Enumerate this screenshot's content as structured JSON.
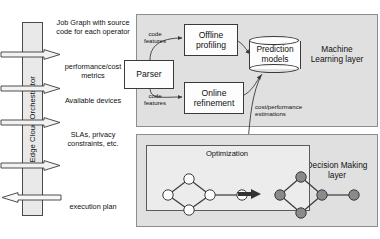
{
  "orchestrator": {
    "label": "Edge Cloud Orchestrator"
  },
  "flows": [
    {
      "name": "job-graph",
      "label": "Job Graph with source code for each operator",
      "direction": "right"
    },
    {
      "name": "perf-metrics",
      "label": "performance/cost metrics",
      "direction": "right"
    },
    {
      "name": "devices",
      "label": "Available devices",
      "direction": "right"
    },
    {
      "name": "slas",
      "label": "SLAs, privacy constraints, etc.",
      "direction": "right"
    },
    {
      "name": "exec-plan",
      "label": "execution plan",
      "direction": "left"
    }
  ],
  "ml_layer": {
    "label": "Machine Learning layer",
    "nodes": {
      "parser": "Parser",
      "offline": "Offline profiling",
      "online": "Online refinement",
      "prediction": "Prediction models"
    },
    "edge_labels": {
      "code_features_top": "code features",
      "code_features_bottom": "code features",
      "cost_performance": "cost/performance estimations"
    }
  },
  "dm_layer": {
    "label": "Decision Making layer",
    "optimization_title": "Optimization",
    "graph_before": {
      "nodes": [
        {
          "id": "a",
          "cx": 12,
          "cy": 32,
          "filled": false
        },
        {
          "id": "b",
          "cx": 33,
          "cy": 16,
          "filled": false
        },
        {
          "id": "c",
          "cx": 33,
          "cy": 47,
          "filled": false
        },
        {
          "id": "d",
          "cx": 54,
          "cy": 32,
          "filled": false
        },
        {
          "id": "e",
          "cx": 86,
          "cy": 32,
          "filled": false
        }
      ],
      "edges": [
        [
          "a",
          "b"
        ],
        [
          "a",
          "c"
        ],
        [
          "b",
          "d"
        ],
        [
          "c",
          "d"
        ],
        [
          "d",
          "e"
        ]
      ]
    },
    "graph_after": {
      "nodes": [
        {
          "id": "a",
          "cx": 12,
          "cy": 32,
          "filled": true
        },
        {
          "id": "b",
          "cx": 33,
          "cy": 14,
          "filled": true
        },
        {
          "id": "c",
          "cx": 33,
          "cy": 50,
          "filled": true
        },
        {
          "id": "d",
          "cx": 54,
          "cy": 32,
          "filled": true
        },
        {
          "id": "e",
          "cx": 86,
          "cy": 32,
          "filled": true
        }
      ],
      "edges": [
        [
          "a",
          "b"
        ],
        [
          "a",
          "c"
        ],
        [
          "b",
          "d"
        ],
        [
          "c",
          "d"
        ],
        [
          "d",
          "e"
        ]
      ]
    },
    "transform_arrow": "thick-right-arrow"
  },
  "colors": {
    "layer_fill": "#e0e0e0",
    "layer_stroke": "#8d8d8d",
    "box_fill": "#fdfdfd",
    "box_stroke": "#3a3a3a",
    "orchestrator_fill": "#e9e9e9",
    "opt_panel_fill": "#ececec",
    "node_open": "#fdfdfd",
    "node_filled": "#8a8a8a",
    "text": "#111111"
  }
}
